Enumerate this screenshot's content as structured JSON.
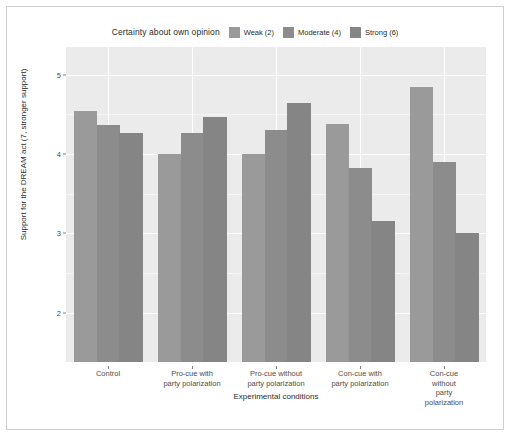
{
  "chart_data": {
    "type": "bar",
    "title": "",
    "legend_title": "Certainty about own opinion",
    "legend_position": "top",
    "grid": true,
    "xlabel": "Experimental conditions",
    "ylabel": "Support for the DREAM act (7, stronger support)",
    "categories": [
      "Control",
      "Pro-cue with\nparty polarization",
      "Pro-cue without\nparty polarization",
      "Con-cue with\nparty polarization",
      "Con-cue without\nparty polarization"
    ],
    "category_lines": [
      [
        "Control"
      ],
      [
        "Pro-cue with",
        "party polarization"
      ],
      [
        "Pro-cue without",
        "party polarization"
      ],
      [
        "Con-cue with",
        "party polarization"
      ],
      [
        "Con-cue without",
        "party polarization"
      ]
    ],
    "series": [
      {
        "name": "Weak (2)",
        "color": "#9a9a9a",
        "values": [
          4.54,
          4.0,
          4.0,
          4.38,
          4.85
        ]
      },
      {
        "name": "Moderate (4)",
        "color": "#8c8c8c",
        "values": [
          4.37,
          4.27,
          4.31,
          3.82,
          3.9
        ]
      },
      {
        "name": "Strong (6)",
        "color": "#858585",
        "values": [
          4.27,
          4.47,
          4.64,
          3.16,
          3.01
        ]
      }
    ],
    "ylim": [
      1.38,
      5.35
    ],
    "ytick_values": [
      2,
      3,
      4,
      5
    ],
    "ytick_labels": [
      "2",
      "3",
      "4",
      "5"
    ],
    "minor_ytick_values": [
      2.5,
      3.5,
      4.5,
      5
    ],
    "panel_background": "#ebebeb",
    "gridline_color": "#ffffff",
    "figure_background": "#ffffff"
  }
}
